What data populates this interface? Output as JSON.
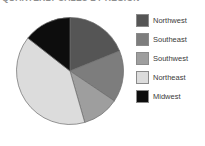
{
  "chart_data": {
    "type": "pie",
    "title": "QUARTERLY SALES BY REGION",
    "title_truncated": true,
    "categories": [
      "Northwest",
      "Southeast",
      "Southwest",
      "Northeast",
      "Midwest"
    ],
    "values": [
      17,
      14,
      10,
      36,
      13
    ],
    "units": "percent",
    "start_angle_deg": 0,
    "direction": "clockwise",
    "legend_position": "right",
    "grid": false,
    "xlabel": "",
    "ylabel": "",
    "slice_colors": [
      "#555555",
      "#7d7d7d",
      "#9e9e9e",
      "#dcdcdc",
      "#0d0d0d"
    ],
    "slices": [
      {
        "label": "Northwest",
        "value": 17,
        "color": "#555555",
        "start_deg": 270,
        "end_deg": 331.2
      },
      {
        "label": "Southeast",
        "value": 14,
        "color": "#7d7d7d",
        "start_deg": 219.6,
        "end_deg": 270
      },
      {
        "label": "Southwest",
        "value": 10,
        "color": "#9e9e9e",
        "start_deg": 183.6,
        "end_deg": 219.6
      },
      {
        "label": "Northeast",
        "value": 36,
        "color": "#dcdcdc",
        "start_deg": 54,
        "end_deg": 183.6
      },
      {
        "label": "Midwest",
        "value": 13,
        "color": "#0d0d0d",
        "start_deg": 0,
        "end_deg": 54
      }
    ],
    "outline_color": "#6b6b6b"
  },
  "legend": {
    "items": [
      {
        "label": "Northwest",
        "color": "#555555"
      },
      {
        "label": "Southeast",
        "color": "#7d7d7d"
      },
      {
        "label": "Southwest",
        "color": "#9e9e9e"
      },
      {
        "label": "Northeast",
        "color": "#dcdcdc"
      },
      {
        "label": "Midwest",
        "color": "#0d0d0d"
      }
    ]
  }
}
